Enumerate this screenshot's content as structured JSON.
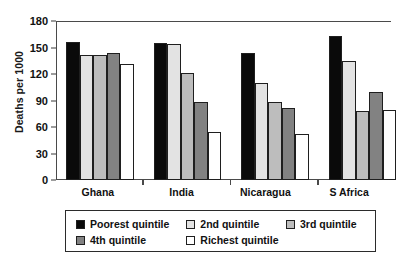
{
  "chart_data": {
    "type": "bar",
    "title": "",
    "xlabel": "",
    "ylabel": "Deaths per 1000",
    "ylim": [
      0,
      180
    ],
    "yticks": [
      0,
      30,
      60,
      90,
      120,
      150,
      180
    ],
    "grid": false,
    "legend_position": "below-axes",
    "categories": [
      "Ghana",
      "India",
      "Nicaragua",
      "S Africa"
    ],
    "series": [
      {
        "name": "Poorest quintile",
        "color": "#0a0a0a",
        "values": [
          156,
          155,
          144,
          163
        ]
      },
      {
        "name": "2nd quintile",
        "color": "#e3e3e3",
        "values": [
          142,
          154,
          110,
          135
        ]
      },
      {
        "name": "3rd quintile",
        "color": "#bdbdbd",
        "values": [
          141,
          121,
          88,
          78
        ]
      },
      {
        "name": "4th quintile",
        "color": "#828282",
        "values": [
          144,
          88,
          81,
          100
        ]
      },
      {
        "name": "Richest quintile",
        "color": "#ffffff",
        "values": [
          131,
          54,
          52,
          79
        ]
      }
    ]
  },
  "axis": {
    "y_title": "Deaths per 1000",
    "y_tick_labels": [
      "180",
      "150",
      "120",
      "90",
      "60",
      "30",
      "0"
    ],
    "x_tick_labels": [
      "Ghana",
      "India",
      "Nicaragua",
      "S Africa"
    ]
  },
  "legend": {
    "row1": [
      {
        "label": "Poorest quintile",
        "swatch": "swatch-poorest"
      },
      {
        "label": "2nd quintile",
        "swatch": "swatch-2nd"
      },
      {
        "label": "3rd quintile",
        "swatch": "swatch-3rd"
      }
    ],
    "row2": [
      {
        "label": "4th quintile",
        "swatch": "swatch-4th"
      },
      {
        "label": "Richest quintile",
        "swatch": "swatch-richest"
      }
    ]
  }
}
